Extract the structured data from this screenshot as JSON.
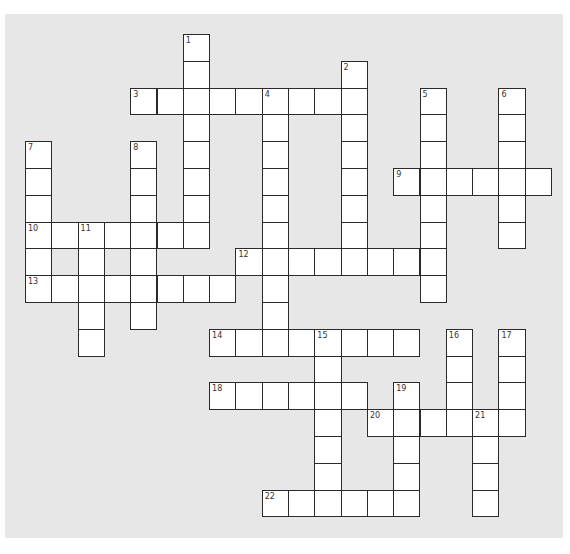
{
  "puzzle": {
    "title": "Crossword",
    "grid": {
      "origin_x": 25,
      "origin_y": 34,
      "cell_w": 26.3,
      "cell_h": 26.8,
      "cols": 20,
      "rows": 18
    },
    "colors": {
      "panel": "#e7e7e7",
      "cell": "#ffffff",
      "border": "#2a2a2a",
      "page": "#ffffff"
    },
    "entries": [
      {
        "number": 1,
        "direction": "down",
        "col": 6,
        "row": 0,
        "length": 8
      },
      {
        "number": 2,
        "direction": "down",
        "col": 12,
        "row": 1,
        "length": 8
      },
      {
        "number": 3,
        "direction": "across",
        "col": 4,
        "row": 2,
        "length": 9
      },
      {
        "number": 4,
        "direction": "down",
        "col": 9,
        "row": 2,
        "length": 10
      },
      {
        "number": 5,
        "direction": "down",
        "col": 15,
        "row": 2,
        "length": 8
      },
      {
        "number": 6,
        "direction": "down",
        "col": 18,
        "row": 2,
        "length": 6
      },
      {
        "number": 7,
        "direction": "down",
        "col": 0,
        "row": 4,
        "length": 6
      },
      {
        "number": 8,
        "direction": "down",
        "col": 4,
        "row": 4,
        "length": 7
      },
      {
        "number": 9,
        "direction": "across",
        "col": 14,
        "row": 5,
        "length": 6
      },
      {
        "number": 10,
        "direction": "across",
        "col": 0,
        "row": 7,
        "length": 7
      },
      {
        "number": 11,
        "direction": "down",
        "col": 2,
        "row": 7,
        "length": 5
      },
      {
        "number": 12,
        "direction": "across",
        "col": 8,
        "row": 8,
        "length": 8
      },
      {
        "number": 13,
        "direction": "across",
        "col": 0,
        "row": 9,
        "length": 8
      },
      {
        "number": 14,
        "direction": "across",
        "col": 7,
        "row": 11,
        "length": 8
      },
      {
        "number": 15,
        "direction": "down",
        "col": 11,
        "row": 11,
        "length": 7
      },
      {
        "number": 16,
        "direction": "down",
        "col": 16,
        "row": 11,
        "length": 4
      },
      {
        "number": 17,
        "direction": "down",
        "col": 18,
        "row": 11,
        "length": 4
      },
      {
        "number": 18,
        "direction": "across",
        "col": 7,
        "row": 13,
        "length": 6
      },
      {
        "number": 19,
        "direction": "down",
        "col": 14,
        "row": 13,
        "length": 5
      },
      {
        "number": 20,
        "direction": "across",
        "col": 13,
        "row": 14,
        "length": 6
      },
      {
        "number": 21,
        "direction": "down",
        "col": 17,
        "row": 14,
        "length": 4
      },
      {
        "number": 22,
        "direction": "across",
        "col": 9,
        "row": 17,
        "length": 6
      }
    ]
  }
}
